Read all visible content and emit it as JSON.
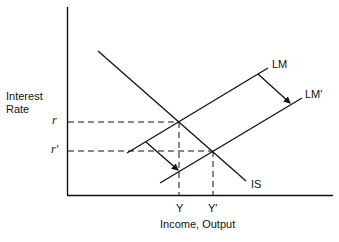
{
  "diagram": {
    "type": "IS-LM",
    "y_axis_label_line1": "Interest",
    "y_axis_label_line2": "Rate",
    "x_axis_label": "Income, Output",
    "curves": {
      "is": "IS",
      "lm": "LM",
      "lm_shifted": "LM′"
    },
    "ticks": {
      "r": "r",
      "r_prime": "r′",
      "y": "Y",
      "y_prime": "Y′"
    },
    "colors": {
      "line": "#111111",
      "background": "#ffffff"
    }
  }
}
